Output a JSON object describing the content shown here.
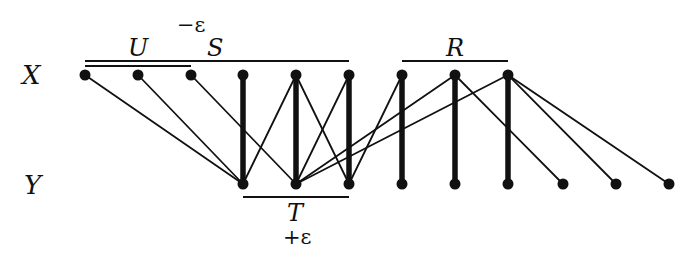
{
  "diagram": {
    "row_labels": {
      "x": "X",
      "y": "Y"
    },
    "set_labels": {
      "U": "U",
      "S": "S",
      "R": "R",
      "T": "T",
      "minus_eps": "−ε",
      "plus_eps": "+ε"
    },
    "colors": {
      "ink": "#111111",
      "background": "#ffffff"
    },
    "top_row_y": 75,
    "bottom_row_y": 184,
    "x_nodes": [
      85,
      138,
      191,
      243,
      296,
      349,
      402,
      455,
      508
    ],
    "y_nodes": [
      243,
      296,
      349,
      402,
      455,
      508,
      563,
      616,
      669
    ],
    "edges": [
      {
        "from": 0,
        "to": 0,
        "thick": false
      },
      {
        "from": 1,
        "to": 0,
        "thick": false
      },
      {
        "from": 2,
        "to": 1,
        "thick": false
      },
      {
        "from": 3,
        "to": 0,
        "thick": true
      },
      {
        "from": 4,
        "to": 0,
        "thick": false
      },
      {
        "from": 4,
        "to": 1,
        "thick": true
      },
      {
        "from": 4,
        "to": 2,
        "thick": false
      },
      {
        "from": 5,
        "to": 1,
        "thick": false
      },
      {
        "from": 5,
        "to": 2,
        "thick": true
      },
      {
        "from": 6,
        "to": 2,
        "thick": false
      },
      {
        "from": 6,
        "to": 3,
        "thick": true
      },
      {
        "from": 7,
        "to": 1,
        "thick": false
      },
      {
        "from": 7,
        "to": 4,
        "thick": true
      },
      {
        "from": 7,
        "to": 6,
        "thick": false
      },
      {
        "from": 8,
        "to": 1,
        "thick": false
      },
      {
        "from": 8,
        "to": 5,
        "thick": true
      },
      {
        "from": 8,
        "to": 7,
        "thick": false
      },
      {
        "from": 8,
        "to": 8,
        "thick": false
      }
    ],
    "brackets": [
      {
        "name": "U",
        "x1": 85,
        "x2": 191,
        "y": 66
      },
      {
        "name": "S",
        "x1": 85,
        "x2": 349,
        "y": 61
      },
      {
        "name": "R",
        "x1": 402,
        "x2": 508,
        "y": 61
      },
      {
        "name": "T",
        "x1": 243,
        "x2": 349,
        "y": 197
      }
    ]
  }
}
